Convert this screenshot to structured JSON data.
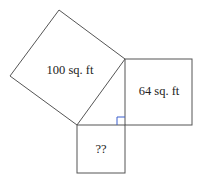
{
  "diagram": {
    "type": "pythagorean-squares",
    "squares": [
      {
        "id": "hypotenuse",
        "label": "100 sq. ft"
      },
      {
        "id": "leg-right",
        "label": "64 sq. ft"
      },
      {
        "id": "leg-bottom",
        "label": "??"
      }
    ],
    "colors": {
      "stroke": "#555555",
      "right_angle": "#3a5fcd"
    }
  }
}
